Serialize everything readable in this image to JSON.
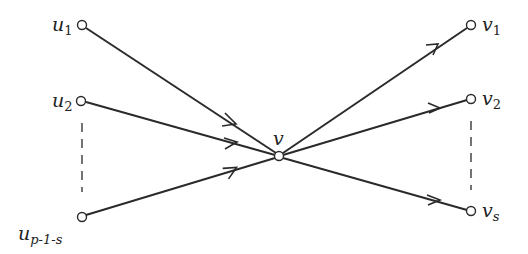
{
  "diagram": {
    "type": "directed graph",
    "center": {
      "id": "v",
      "label": "v",
      "x": 279,
      "y": 156
    },
    "in_nodes": [
      {
        "id": "u1",
        "base": "u",
        "sub": "1",
        "x": 82,
        "y": 25
      },
      {
        "id": "u2",
        "base": "u",
        "sub": "2",
        "x": 81,
        "y": 101
      },
      {
        "id": "u_p-1-s",
        "base": "u",
        "sub": "p-1-s",
        "x": 82,
        "y": 217
      }
    ],
    "out_nodes": [
      {
        "id": "v1",
        "base": "v",
        "sub": "1",
        "x": 471,
        "y": 25
      },
      {
        "id": "v2",
        "base": "v",
        "sub": "2",
        "x": 471,
        "y": 99
      },
      {
        "id": "vs",
        "base": "v",
        "sub": "s",
        "x": 471,
        "y": 211
      }
    ],
    "edges": [
      {
        "from": "u1",
        "to": "v"
      },
      {
        "from": "u2",
        "to": "v"
      },
      {
        "from": "u_p-1-s",
        "to": "v"
      },
      {
        "from": "v",
        "to": "v1"
      },
      {
        "from": "v",
        "to": "v2"
      },
      {
        "from": "v",
        "to": "vs"
      }
    ],
    "ellipses": [
      {
        "side": "left",
        "between": [
          "u2",
          "u_p-1-s"
        ],
        "style": "dashed"
      },
      {
        "side": "right",
        "between": [
          "v2",
          "vs"
        ],
        "style": "dashed"
      }
    ]
  },
  "labels": {
    "u1": {
      "base": "u",
      "sub": "1"
    },
    "u2": {
      "base": "u",
      "sub": "2"
    },
    "up": {
      "base": "u",
      "sub": "p-1-s"
    },
    "v": {
      "base": "v"
    },
    "v1": {
      "base": "v",
      "sub": "1"
    },
    "v2": {
      "base": "v",
      "sub": "2"
    },
    "vs": {
      "base": "v",
      "sub": "s"
    }
  }
}
